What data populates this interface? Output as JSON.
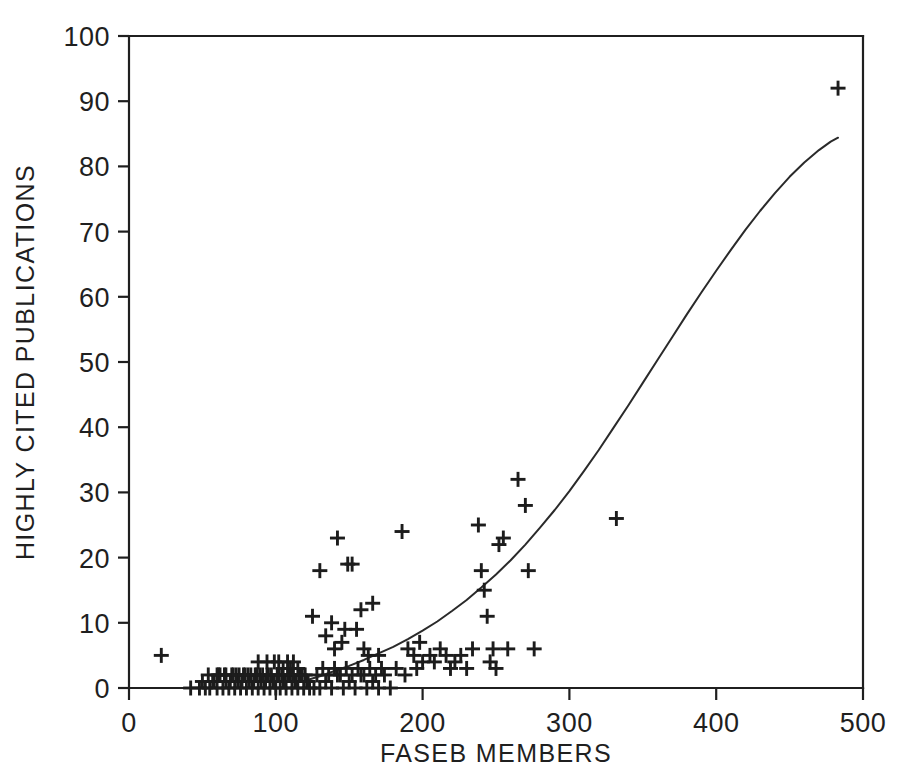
{
  "chart_data": {
    "type": "scatter",
    "title": "",
    "xlabel": "FASEB MEMBERS",
    "ylabel": "HIGHLY CITED PUBLICATIONS",
    "xlim": [
      0,
      500
    ],
    "ylim": [
      0,
      100
    ],
    "xticks": [
      0,
      100,
      200,
      300,
      400,
      500
    ],
    "yticks": [
      0,
      10,
      20,
      30,
      40,
      50,
      60,
      70,
      80,
      90,
      100
    ],
    "xtick_labels": [
      "0",
      "100",
      "200",
      "300",
      "400",
      "500"
    ],
    "ytick_labels": [
      "0",
      "10",
      "20",
      "30",
      "40",
      "50",
      "60",
      "70",
      "80",
      "90",
      "100"
    ],
    "grid": false,
    "legend": null,
    "marker": "plus",
    "marker_color": "#1c1c1c",
    "axis_color": "#1f1f1f",
    "curve_color": "#2a2a2a",
    "series": [
      {
        "name": "institutions",
        "marker": "plus",
        "points": [
          [
            22,
            5
          ],
          [
            42,
            0
          ],
          [
            48,
            0
          ],
          [
            52,
            0
          ],
          [
            55,
            0
          ],
          [
            58,
            1
          ],
          [
            60,
            0
          ],
          [
            62,
            2
          ],
          [
            64,
            0
          ],
          [
            66,
            1
          ],
          [
            68,
            0
          ],
          [
            70,
            2
          ],
          [
            72,
            0
          ],
          [
            74,
            1
          ],
          [
            76,
            0
          ],
          [
            78,
            2
          ],
          [
            80,
            0
          ],
          [
            82,
            1
          ],
          [
            84,
            0
          ],
          [
            86,
            2
          ],
          [
            88,
            0
          ],
          [
            90,
            1
          ],
          [
            92,
            0
          ],
          [
            94,
            2
          ],
          [
            96,
            0
          ],
          [
            98,
            1
          ],
          [
            100,
            0
          ],
          [
            101,
            2
          ],
          [
            103,
            0
          ],
          [
            105,
            1
          ],
          [
            107,
            0
          ],
          [
            109,
            2
          ],
          [
            111,
            0
          ],
          [
            113,
            1
          ],
          [
            115,
            0
          ],
          [
            117,
            2
          ],
          [
            119,
            0
          ],
          [
            121,
            1
          ],
          [
            123,
            0
          ],
          [
            50,
            1
          ],
          [
            54,
            2
          ],
          [
            57,
            1
          ],
          [
            61,
            2
          ],
          [
            65,
            2
          ],
          [
            69,
            1
          ],
          [
            73,
            2
          ],
          [
            77,
            1
          ],
          [
            81,
            2
          ],
          [
            85,
            1
          ],
          [
            89,
            2
          ],
          [
            93,
            1
          ],
          [
            97,
            2
          ],
          [
            99,
            1
          ],
          [
            102,
            2
          ],
          [
            106,
            1
          ],
          [
            110,
            2
          ],
          [
            114,
            1
          ],
          [
            118,
            2
          ],
          [
            122,
            1
          ],
          [
            60,
            2
          ],
          [
            66,
            2
          ],
          [
            71,
            2
          ],
          [
            75,
            2
          ],
          [
            79,
            2
          ],
          [
            83,
            2
          ],
          [
            87,
            2
          ],
          [
            91,
            2
          ],
          [
            95,
            2
          ],
          [
            104,
            2
          ],
          [
            108,
            2
          ],
          [
            112,
            2
          ],
          [
            116,
            2
          ],
          [
            120,
            2
          ],
          [
            88,
            4
          ],
          [
            94,
            4
          ],
          [
            99,
            4
          ],
          [
            102,
            4
          ],
          [
            105,
            3
          ],
          [
            108,
            4
          ],
          [
            110,
            3
          ],
          [
            112,
            4
          ],
          [
            115,
            3
          ],
          [
            126,
            0
          ],
          [
            130,
            0
          ],
          [
            134,
            1
          ],
          [
            138,
            0
          ],
          [
            142,
            2
          ],
          [
            146,
            0
          ],
          [
            150,
            1
          ],
          [
            154,
            0
          ],
          [
            158,
            2
          ],
          [
            162,
            0
          ],
          [
            166,
            1
          ],
          [
            170,
            0
          ],
          [
            174,
            2
          ],
          [
            128,
            2
          ],
          [
            132,
            3
          ],
          [
            136,
            2
          ],
          [
            140,
            3
          ],
          [
            144,
            2
          ],
          [
            148,
            3
          ],
          [
            152,
            2
          ],
          [
            156,
            3
          ],
          [
            160,
            2
          ],
          [
            164,
            3
          ],
          [
            168,
            2
          ],
          [
            172,
            3
          ],
          [
            125,
            11
          ],
          [
            130,
            18
          ],
          [
            134,
            8
          ],
          [
            138,
            10
          ],
          [
            140,
            6
          ],
          [
            142,
            23
          ],
          [
            145,
            7
          ],
          [
            147,
            9
          ],
          [
            149,
            19
          ],
          [
            152,
            19
          ],
          [
            155,
            9
          ],
          [
            158,
            12
          ],
          [
            160,
            6
          ],
          [
            163,
            5
          ],
          [
            166,
            13
          ],
          [
            170,
            5
          ],
          [
            178,
            0
          ],
          [
            182,
            3
          ],
          [
            186,
            24
          ],
          [
            188,
            2
          ],
          [
            190,
            6
          ],
          [
            194,
            5
          ],
          [
            196,
            3
          ],
          [
            198,
            7
          ],
          [
            200,
            4
          ],
          [
            205,
            5
          ],
          [
            208,
            4
          ],
          [
            212,
            6
          ],
          [
            216,
            5
          ],
          [
            219,
            3
          ],
          [
            222,
            4
          ],
          [
            226,
            5
          ],
          [
            230,
            3
          ],
          [
            234,
            6
          ],
          [
            238,
            25
          ],
          [
            240,
            18
          ],
          [
            242,
            15
          ],
          [
            244,
            11
          ],
          [
            246,
            4
          ],
          [
            248,
            6
          ],
          [
            250,
            3
          ],
          [
            252,
            22
          ],
          [
            255,
            23
          ],
          [
            258,
            6
          ],
          [
            265,
            32
          ],
          [
            270,
            28
          ],
          [
            272,
            18
          ],
          [
            276,
            6
          ],
          [
            332,
            26
          ],
          [
            483,
            92
          ]
        ]
      }
    ],
    "fit_curve": {
      "name": "regression-curve",
      "points": [
        [
          118,
          1.0
        ],
        [
          130,
          1.8
        ],
        [
          140,
          2.6
        ],
        [
          150,
          3.4
        ],
        [
          160,
          4.3
        ],
        [
          170,
          5.3
        ],
        [
          180,
          6.3
        ],
        [
          190,
          7.5
        ],
        [
          200,
          8.8
        ],
        [
          210,
          10.2
        ],
        [
          220,
          11.8
        ],
        [
          230,
          13.5
        ],
        [
          240,
          15.4
        ],
        [
          250,
          17.4
        ],
        [
          260,
          19.6
        ],
        [
          270,
          22.0
        ],
        [
          280,
          24.6
        ],
        [
          290,
          27.3
        ],
        [
          300,
          30.2
        ],
        [
          310,
          33.3
        ],
        [
          320,
          36.5
        ],
        [
          330,
          39.9
        ],
        [
          340,
          43.3
        ],
        [
          350,
          46.8
        ],
        [
          360,
          50.3
        ],
        [
          370,
          53.8
        ],
        [
          380,
          57.3
        ],
        [
          390,
          60.7
        ],
        [
          400,
          64.0
        ],
        [
          410,
          67.2
        ],
        [
          420,
          70.3
        ],
        [
          430,
          73.2
        ],
        [
          440,
          75.9
        ],
        [
          450,
          78.4
        ],
        [
          460,
          80.6
        ],
        [
          470,
          82.5
        ],
        [
          478,
          83.8
        ],
        [
          483,
          84.4
        ]
      ]
    }
  }
}
